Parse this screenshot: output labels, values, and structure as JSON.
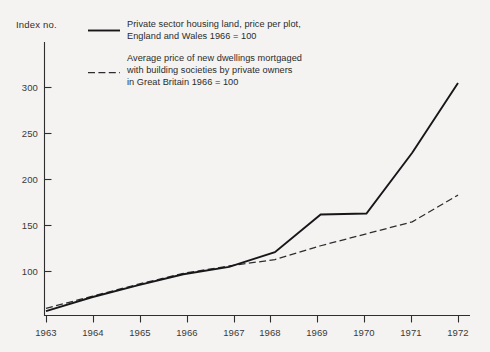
{
  "chart_data": {
    "type": "line",
    "title": "",
    "ylabel": "Index no.",
    "xlabel": "",
    "grid": false,
    "legend_position": "top-left-inside",
    "x": [
      1963,
      1964,
      1965,
      1966,
      1967,
      1968,
      1969,
      1970,
      1971,
      1972
    ],
    "xlim": [
      1963,
      1972
    ],
    "ylim": [
      50,
      320
    ],
    "yticks": [
      100,
      150,
      200,
      250,
      300
    ],
    "ytick_labels": [
      "100",
      "150",
      "200",
      "250",
      "300"
    ],
    "xtick_labels": [
      "1963",
      "1964",
      "1965",
      "1966",
      "1967",
      "1968",
      "1969",
      "1970",
      "1971",
      "1972"
    ],
    "series": [
      {
        "name": "Private sector housing land, price per plot, England and Wales 1966 = 100",
        "style": "solid",
        "color": "#17171a",
        "values": [
          57,
          72,
          85,
          97,
          105,
          121,
          162,
          163,
          229,
          305
        ]
      },
      {
        "name": "Average price of new dwellings mortgaged with building societies by private owners in Great Britain 1966 = 100",
        "style": "dashed",
        "color": "#2d2d30",
        "values": [
          60,
          73,
          86,
          98,
          106,
          113,
          128,
          141,
          154,
          183
        ]
      }
    ]
  },
  "axis": {
    "y_title": "Index no."
  },
  "legend": {
    "entries": [
      {
        "style": "solid",
        "lines": [
          "Private sector housing land, price per plot,",
          "England and Wales 1966 = 100"
        ]
      },
      {
        "style": "dashed",
        "lines": [
          "Average price of new dwellings mortgaged",
          "with building societies by private owners",
          "in Great Britain 1966 = 100"
        ]
      }
    ]
  }
}
